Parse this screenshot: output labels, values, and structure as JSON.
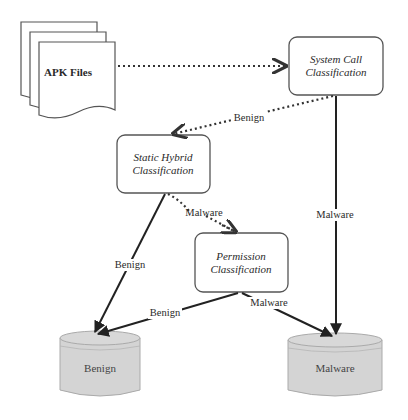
{
  "diagram": {
    "nodes": {
      "apk_files": {
        "label": "APK Files"
      },
      "system_call": {
        "line1": "System Call",
        "line2": "Classification"
      },
      "static_hybrid": {
        "line1": "Static Hybrid",
        "line2": "Classification"
      },
      "permission": {
        "line1": "Permission",
        "line2": "Classification"
      },
      "benign_store": {
        "label": "Benign"
      },
      "malware_store": {
        "label": "Malware"
      }
    },
    "edges": {
      "apk_to_syscall": {
        "label": ""
      },
      "syscall_to_static": {
        "label": "Benign"
      },
      "syscall_to_malware": {
        "label": "Malware"
      },
      "static_to_permission": {
        "label": "Malware"
      },
      "static_to_benign": {
        "label": "Benign"
      },
      "permission_to_benign": {
        "label": "Benign"
      },
      "permission_to_malware": {
        "label": "Malware"
      }
    },
    "colors": {
      "stroke": "#333333",
      "store_fill": "#d4d4d4",
      "box_fill": "#ffffff"
    }
  }
}
